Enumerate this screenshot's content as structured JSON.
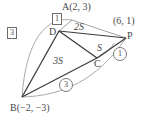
{
  "figure": {
    "type": "geometry-diagram",
    "colors": {
      "segment": "#3d3d3d",
      "arc": "#9a9a9a",
      "text": "#4a4a4a",
      "background": "#ffffff"
    },
    "points": [
      {
        "name": "A",
        "label": "A",
        "coord_label": "(2, 3)",
        "x": 72,
        "y": 20
      },
      {
        "name": "D",
        "label": "D",
        "coord_label": "",
        "x": 59,
        "y": 31
      },
      {
        "name": "P",
        "label": "P",
        "coord_label": "(6, 1)",
        "x": 126,
        "y": 38
      },
      {
        "name": "C",
        "label": "C",
        "coord_label": "",
        "x": 97,
        "y": 58
      },
      {
        "name": "B",
        "label": "B",
        "coord_label": "(−2, −3)",
        "x": 22,
        "y": 97
      }
    ],
    "labels": {
      "a_full": "A(2, 3)",
      "b_full": "B(−2, −3)",
      "p_coord": "(6, 1)",
      "p_point": "P",
      "d_point": "D",
      "c_point": "C",
      "area_s": "S",
      "area_2s": "2S",
      "area_3s": "3S"
    },
    "ratio_markers": [
      {
        "name": "ratio-box-1",
        "style": "box",
        "value": "1",
        "x": 52,
        "y": 14
      },
      {
        "name": "ratio-box-3",
        "style": "box",
        "value": "3",
        "x": 8,
        "y": 27
      },
      {
        "name": "ratio-circle-1",
        "style": "circle",
        "value": "①",
        "text": "1",
        "x": 114,
        "y": 49
      },
      {
        "name": "ratio-circle-3",
        "style": "circle",
        "value": "③",
        "text": "3",
        "x": 60,
        "y": 79
      }
    ],
    "segments": [
      {
        "name": "segment-a-d",
        "from": "A",
        "to": "D"
      },
      {
        "name": "segment-a-p",
        "from": "A",
        "to": "P"
      },
      {
        "name": "segment-d-p",
        "from": "D",
        "to": "P"
      },
      {
        "name": "segment-d-c",
        "from": "D",
        "to": "C"
      },
      {
        "name": "segment-c-p",
        "from": "C",
        "to": "P"
      },
      {
        "name": "segment-d-b",
        "from": "D",
        "to": "B"
      },
      {
        "name": "segment-b-c",
        "from": "B",
        "to": "C"
      },
      {
        "name": "segment-a-b-arc",
        "from": "A",
        "to": "B"
      },
      {
        "name": "segment-b-p-arc",
        "from": "B",
        "to": "P"
      }
    ]
  }
}
